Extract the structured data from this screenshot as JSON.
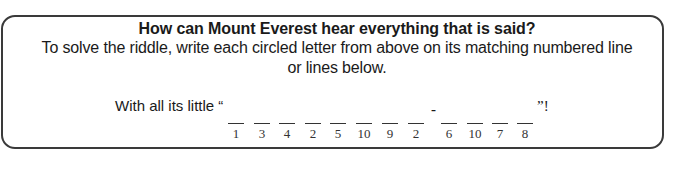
{
  "riddle": {
    "title": "How can Mount Everest hear everything that is said?",
    "instructions_line1": "To solve the riddle, write each circled letter from above on its matching numbered line",
    "instructions_line2": "or lines below.",
    "answer_prefix": "With all its little “",
    "hyphen": "-",
    "answer_suffix": "”!",
    "blanks": [
      {
        "number": "1",
        "x": 228
      },
      {
        "number": "3",
        "x": 254
      },
      {
        "number": "4",
        "x": 279
      },
      {
        "number": "2",
        "x": 305
      },
      {
        "number": "5",
        "x": 330
      },
      {
        "number": "10",
        "x": 356
      },
      {
        "number": "9",
        "x": 382
      },
      {
        "number": "2",
        "x": 408
      },
      {
        "number": "6",
        "x": 441
      },
      {
        "number": "10",
        "x": 467
      },
      {
        "number": "7",
        "x": 492
      },
      {
        "number": "8",
        "x": 517
      }
    ]
  }
}
